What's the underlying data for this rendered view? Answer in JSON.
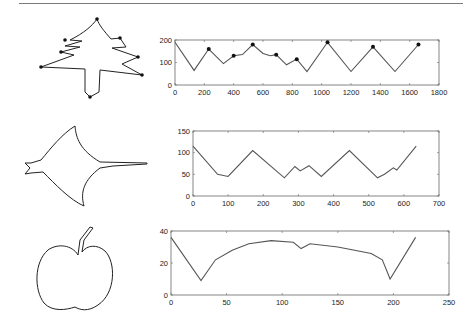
{
  "figure": {
    "rows": [
      {
        "shape": "tree",
        "shape_icon": "tree-silhouette-icon"
      },
      {
        "shape": "manta-ray",
        "shape_icon": "manta-ray-silhouette-icon"
      },
      {
        "shape": "apple",
        "shape_icon": "apple-silhouette-icon"
      }
    ]
  },
  "chart_data": [
    {
      "type": "line",
      "title": "",
      "xlabel": "",
      "ylabel": "",
      "xlim": [
        0,
        1800
      ],
      "ylim": [
        0,
        200
      ],
      "xticks": [
        "0",
        "200",
        "400",
        "600",
        "800",
        "1000",
        "1200",
        "1400",
        "1600",
        "1800"
      ],
      "yticks": [
        "0",
        "100",
        "200"
      ],
      "grid": false,
      "series": [
        {
          "name": "tree contour distance",
          "x": [
            0,
            130,
            230,
            330,
            400,
            460,
            530,
            600,
            650,
            690,
            760,
            830,
            900,
            1040,
            1200,
            1350,
            1500,
            1660
          ],
          "y": [
            190,
            65,
            160,
            95,
            130,
            135,
            180,
            140,
            130,
            135,
            90,
            115,
            60,
            190,
            60,
            170,
            60,
            180
          ]
        }
      ],
      "markers": {
        "x": [
          230,
          400,
          530,
          690,
          830,
          1040,
          1350,
          1660
        ],
        "y": [
          160,
          130,
          180,
          135,
          115,
          190,
          170,
          180
        ]
      }
    },
    {
      "type": "line",
      "title": "",
      "xlabel": "",
      "ylabel": "",
      "xlim": [
        0,
        700
      ],
      "ylim": [
        0,
        150
      ],
      "xticks": [
        "0",
        "100",
        "200",
        "300",
        "400",
        "500",
        "600",
        "700"
      ],
      "yticks": [
        "0",
        "50",
        "100",
        "150"
      ],
      "grid": false,
      "series": [
        {
          "name": "manta contour distance",
          "x": [
            0,
            70,
            100,
            170,
            260,
            290,
            305,
            330,
            365,
            445,
            525,
            545,
            570,
            580,
            635
          ],
          "y": [
            115,
            50,
            45,
            105,
            42,
            68,
            58,
            70,
            45,
            105,
            42,
            50,
            65,
            60,
            115
          ]
        }
      ]
    },
    {
      "type": "line",
      "title": "",
      "xlabel": "",
      "ylabel": "",
      "xlim": [
        0,
        250
      ],
      "ylim": [
        0,
        40
      ],
      "xticks": [
        "0",
        "50",
        "100",
        "150",
        "200",
        "250"
      ],
      "yticks": [
        "0",
        "20",
        "40"
      ],
      "grid": false,
      "series": [
        {
          "name": "apple contour distance",
          "x": [
            0,
            27,
            40,
            55,
            70,
            90,
            110,
            117,
            125,
            150,
            180,
            190,
            197,
            220
          ],
          "y": [
            36,
            9,
            22,
            28,
            32,
            34,
            33,
            29,
            32,
            30,
            26,
            22,
            10,
            36
          ]
        }
      ]
    }
  ]
}
